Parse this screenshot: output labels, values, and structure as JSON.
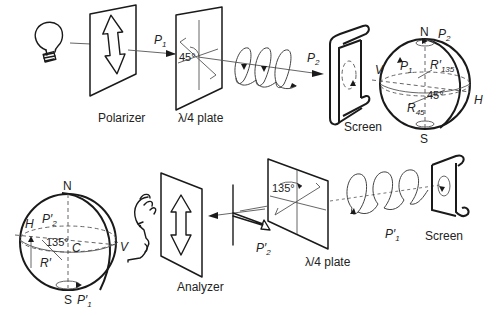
{
  "diagram": {
    "top_row": {
      "components": [
        {
          "name": "light-bulb",
          "label": ""
        },
        {
          "name": "polarizer",
          "label": "Polarizer"
        },
        {
          "name": "quarter-wave-plate",
          "label": "λ/4 plate",
          "angle": "45°"
        },
        {
          "name": "screen",
          "label": "Screen"
        },
        {
          "name": "poincare-sphere",
          "label": ""
        }
      ],
      "beam_labels": {
        "p1": "P",
        "p1_sub": "1",
        "p2": "P",
        "p2_sub": "2"
      },
      "sphere": {
        "north": "N",
        "south": "S",
        "v": "V",
        "h": "H",
        "p1": "P",
        "p1_sub": "1",
        "p2": "P",
        "p2_sub": "2",
        "r135": "R′",
        "r135_sub": "135",
        "r45": "R",
        "r45_sub": "45",
        "angle": "45°"
      }
    },
    "bottom_row": {
      "components": [
        {
          "name": "poincare-sphere",
          "label": ""
        },
        {
          "name": "observer-face",
          "label": ""
        },
        {
          "name": "analyzer",
          "label": "Analyzer"
        },
        {
          "name": "quarter-wave-plate",
          "label": "λ/4 plate",
          "angle": "135°"
        },
        {
          "name": "screen",
          "label": "Screen"
        }
      ],
      "beam_labels": {
        "p1prime": "P′",
        "p1prime_sub": "1",
        "p2prime": "P′",
        "p2prime_sub": "2"
      },
      "sphere": {
        "north": "N",
        "south": "S",
        "v": "V",
        "h": "H",
        "c": "C",
        "p2prime": "P′",
        "p2prime_sub": "2",
        "p1prime": "P′",
        "p1prime_sub": "1",
        "rprime": "R′",
        "angle": "135°"
      }
    }
  }
}
